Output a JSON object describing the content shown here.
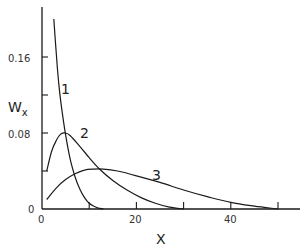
{
  "chart_data": {
    "type": "line",
    "title": "",
    "xlabel": "X",
    "ylabel": "W",
    "ylabel_subscript": "x",
    "xlim": [
      0,
      55
    ],
    "ylim": [
      0,
      0.21
    ],
    "x_ticks": [
      0,
      10,
      20,
      30,
      40,
      50
    ],
    "x_tick_labels": [
      "0",
      "",
      "20",
      "",
      "40",
      ""
    ],
    "y_ticks": [
      0,
      0.04,
      0.08,
      0.12,
      0.16
    ],
    "y_tick_labels": [
      "0",
      "",
      "0.08",
      "",
      "0.16"
    ],
    "grid": false,
    "legend": "inline curve labels",
    "series": [
      {
        "name": "1",
        "x": [
          2.5,
          3,
          3.5,
          4,
          5,
          6,
          7,
          8,
          9,
          10,
          11,
          12,
          13
        ],
        "y": [
          0.2,
          0.165,
          0.135,
          0.112,
          0.078,
          0.052,
          0.034,
          0.021,
          0.012,
          0.006,
          0.003,
          0.001,
          0.0
        ]
      },
      {
        "name": "2",
        "x": [
          1,
          2,
          3,
          4,
          5,
          6,
          8,
          10,
          12,
          15,
          18,
          21,
          24,
          27,
          30
        ],
        "y": [
          0.04,
          0.06,
          0.072,
          0.079,
          0.08,
          0.077,
          0.066,
          0.054,
          0.043,
          0.03,
          0.02,
          0.012,
          0.006,
          0.002,
          0.0
        ]
      },
      {
        "name": "3",
        "x": [
          1,
          3,
          5,
          7,
          9,
          11,
          13,
          16,
          20,
          25,
          30,
          35,
          40,
          45,
          50
        ],
        "y": [
          0.01,
          0.022,
          0.031,
          0.037,
          0.041,
          0.042,
          0.042,
          0.04,
          0.035,
          0.028,
          0.02,
          0.013,
          0.007,
          0.003,
          0.0
        ]
      }
    ]
  },
  "labels": {
    "y_axis_main": "W",
    "y_axis_sub": "x",
    "x_axis": "X",
    "y_tick_0": "0",
    "y_tick_008": "0.08",
    "y_tick_016": "0.16",
    "x_tick_0": "0",
    "x_tick_20": "20",
    "x_tick_40": "40",
    "curve_1": "1",
    "curve_2": "2",
    "curve_3": "3"
  }
}
